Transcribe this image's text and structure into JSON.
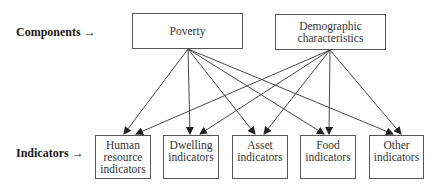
{
  "labels": {
    "components": "Components →",
    "indicators": "Indicators →"
  },
  "components": [
    {
      "id": "poverty",
      "lines": [
        "Poverty"
      ]
    },
    {
      "id": "demographic",
      "lines": [
        "Demographic",
        "characteristics"
      ]
    }
  ],
  "indicators": [
    {
      "id": "human",
      "lines": [
        "Human",
        "resource",
        "indicators"
      ]
    },
    {
      "id": "dwelling",
      "lines": [
        "Dwelling",
        "indicators"
      ]
    },
    {
      "id": "asset",
      "lines": [
        "Asset",
        "indicators"
      ]
    },
    {
      "id": "food",
      "lines": [
        "Food",
        "indicators"
      ]
    },
    {
      "id": "other",
      "lines": [
        "Other",
        "indicators"
      ]
    }
  ],
  "edges": [
    {
      "from": "poverty",
      "to": "human"
    },
    {
      "from": "poverty",
      "to": "dwelling"
    },
    {
      "from": "poverty",
      "to": "asset"
    },
    {
      "from": "poverty",
      "to": "food"
    },
    {
      "from": "poverty",
      "to": "other"
    },
    {
      "from": "demographic",
      "to": "human"
    },
    {
      "from": "demographic",
      "to": "dwelling"
    },
    {
      "from": "demographic",
      "to": "asset"
    },
    {
      "from": "demographic",
      "to": "food"
    },
    {
      "from": "demographic",
      "to": "other"
    }
  ],
  "colors": {
    "line": "#333333",
    "box_border": "#555555"
  }
}
